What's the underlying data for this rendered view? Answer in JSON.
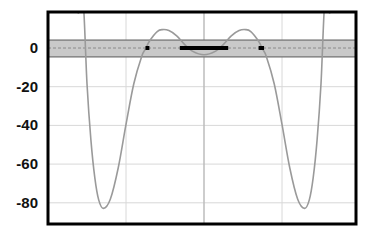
{
  "chart_data": {
    "type": "line",
    "title": "",
    "xlabel": "",
    "ylabel": "",
    "xlim": [
      -2.0,
      1.95
    ],
    "ylim": [
      -91,
      18.6
    ],
    "grid": true,
    "x_gridlines": [
      -1,
      0,
      1
    ],
    "y_ticks": [
      0,
      -20,
      -40,
      -60,
      -80
    ],
    "y_tick_labels": [
      "0",
      "-20",
      "-40",
      "-60",
      "-80"
    ],
    "x_tick_labels": [],
    "series": [
      {
        "name": "f(x)",
        "color": "#9a9a9a",
        "x": [
          -1.62,
          -1.6,
          -1.55,
          -1.5,
          -1.45,
          -1.4,
          -1.35,
          -1.29,
          -1.2,
          -1.1,
          -1.0,
          -0.9,
          -0.8,
          -0.75,
          -0.7,
          -0.6,
          -0.53,
          -0.45,
          -0.35,
          -0.25,
          -0.15,
          0.0,
          0.15,
          0.25,
          0.35,
          0.45,
          0.53,
          0.6,
          0.7,
          0.75,
          0.8,
          0.9,
          1.0,
          1.1,
          1.2,
          1.29,
          1.35,
          1.4,
          1.45,
          1.5,
          1.55,
          1.6,
          1.62
        ],
        "y": [
          18.6,
          18.6,
          25.1,
          -18.5,
          -47.5,
          -67.0,
          -78.5,
          -82.9,
          -78.0,
          -62.0,
          -39.5,
          -18.5,
          -4.5,
          -0.5,
          3.5,
          8.5,
          9.5,
          9.0,
          6.3,
          1.9,
          -1.6,
          -3.5,
          -1.6,
          1.9,
          6.3,
          9.0,
          9.5,
          8.5,
          3.5,
          -0.5,
          -4.5,
          -18.5,
          -39.5,
          -62.0,
          -78.0,
          -82.9,
          -78.5,
          -67.0,
          -47.5,
          -18.5,
          25.1,
          18.6,
          18.6
        ]
      }
    ],
    "annotations": {
      "tolerance_band": {
        "y_min": -4.6,
        "y_max": 4.1,
        "center": 0,
        "fill": "#c9c9c9"
      },
      "highlighted_segments": [
        {
          "x_start": -0.75,
          "x_end": -0.7,
          "y": 0
        },
        {
          "x_start": -0.31,
          "x_end": 0.31,
          "y": 0
        },
        {
          "x_start": 0.7,
          "x_end": 0.77,
          "y": 0
        }
      ]
    }
  }
}
